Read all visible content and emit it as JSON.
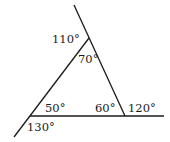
{
  "diagram": {
    "type": "triangle-exterior-angles",
    "colors": {
      "line": "#1a1a1a",
      "text": "#1a1a1a",
      "background": "#ffffff"
    },
    "labels": {
      "top_exterior": "110°",
      "top_interior": "70°",
      "left_interior": "50°",
      "right_interior": "60°",
      "right_exterior": "120°",
      "left_exterior": "130°"
    }
  }
}
